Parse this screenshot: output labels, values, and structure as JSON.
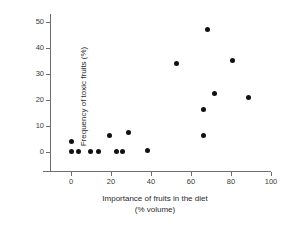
{
  "chart_data": {
    "type": "scatter",
    "title": "",
    "xlabel": "Importance of fruits in the diet",
    "xlabel_sub": "(% volume)",
    "ylabel": "Frequency of toxic fruits (%)",
    "xlim": [
      -6,
      108
    ],
    "ylim": [
      -2.5,
      54
    ],
    "grid": false,
    "legend": null,
    "xticks": [
      0,
      20,
      40,
      60,
      80,
      100
    ],
    "xtick_labels": [
      "0",
      "20",
      "40",
      "60",
      "80",
      "100"
    ],
    "yticks": [
      0,
      10,
      20,
      30,
      40,
      50
    ],
    "ytick_labels": [
      "0",
      "10",
      "20",
      "30",
      "40",
      "50"
    ],
    "marker": "filled-circle",
    "marker_color": "#111111",
    "axis_color": "#6e6e6e",
    "points": [
      {
        "x": 0.0,
        "y": 4.2
      },
      {
        "x": 0.0,
        "y": 0.2
      },
      {
        "x": 3.5,
        "y": 0.2
      },
      {
        "x": 9.5,
        "y": 0.2
      },
      {
        "x": 13.5,
        "y": 0.2
      },
      {
        "x": 19.0,
        "y": 6.5
      },
      {
        "x": 22.5,
        "y": 0.3
      },
      {
        "x": 25.5,
        "y": 0.3
      },
      {
        "x": 28.5,
        "y": 7.6
      },
      {
        "x": 38.0,
        "y": 0.6
      },
      {
        "x": 52.5,
        "y": 34.0
      },
      {
        "x": 66.0,
        "y": 6.5
      },
      {
        "x": 66.0,
        "y": 16.2
      },
      {
        "x": 68.0,
        "y": 47.0
      },
      {
        "x": 71.5,
        "y": 22.4
      },
      {
        "x": 80.5,
        "y": 35.2
      },
      {
        "x": 88.5,
        "y": 20.8
      }
    ]
  }
}
